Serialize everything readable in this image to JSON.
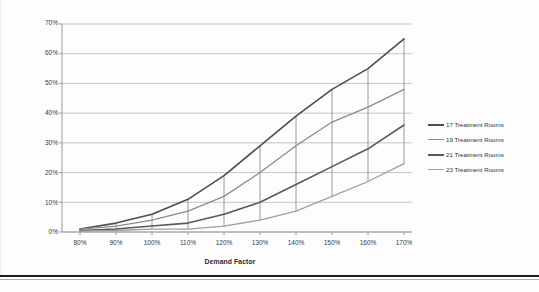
{
  "chart_data": {
    "type": "line",
    "title": "",
    "xlabel": "Demand Factor",
    "ylabel": "Percent of Patients",
    "categories": [
      "80%",
      "90%",
      "100%",
      "110%",
      "120%",
      "130%",
      "140%",
      "150%",
      "160%",
      "170%"
    ],
    "x": [
      80,
      90,
      100,
      110,
      120,
      130,
      140,
      150,
      160,
      170
    ],
    "xlim": [
      75,
      175
    ],
    "ylim": [
      0,
      70
    ],
    "y_ticks": [
      "0%",
      "10%",
      "20%",
      "30%",
      "40%",
      "50%",
      "60%",
      "70%"
    ],
    "y_tick_values": [
      0,
      10,
      20,
      30,
      40,
      50,
      60,
      70
    ],
    "x_ticks": [
      "80%",
      "90%",
      "100%",
      "110%",
      "120%",
      "130%",
      "140%",
      "150%",
      "160%",
      "170%"
    ],
    "grid": "horizontal",
    "legend_position": "right",
    "series": [
      {
        "name": "17 Treatment Rooms",
        "color": "#4d4d4d",
        "width": 1.6,
        "values": [
          1,
          3,
          6,
          11,
          19,
          29,
          39,
          48,
          55,
          65
        ]
      },
      {
        "name": "19 Treatment Rooms",
        "color": "#8c8c8c",
        "width": 1.3,
        "values": [
          1,
          2,
          4,
          7,
          12,
          20,
          29,
          37,
          42,
          48
        ]
      },
      {
        "name": "21 Treatment Rooms",
        "color": "#595959",
        "width": 1.6,
        "values": [
          0.5,
          1,
          2,
          3,
          6,
          10,
          16,
          22,
          28,
          36
        ]
      },
      {
        "name": "23 Treatment Rooms",
        "color": "#9e9e9e",
        "width": 1.3,
        "values": [
          0.3,
          0.5,
          1,
          1,
          2,
          4,
          7,
          12,
          17,
          23
        ]
      }
    ],
    "droplines": {
      "present": true,
      "color": "#808080",
      "description": "vertical connector lines at each category joining the highest and lowest series"
    },
    "axis_color": "#9a9a9a",
    "grid_color": "#b8b8b8"
  },
  "legend": {
    "items": [
      {
        "label": "17 Treatment Rooms"
      },
      {
        "label": "19 Treatment Rooms"
      },
      {
        "label": "21 Treatment Rooms"
      },
      {
        "label": "23 Treatment Rooms"
      }
    ]
  },
  "axes": {
    "y_title": "Percent of Patients",
    "x_title": "Demand Factor",
    "y_labels": [
      "70%",
      "60%",
      "50%",
      "40%",
      "30%",
      "20%",
      "10%",
      "0%"
    ],
    "x_labels": [
      "80%",
      "90%",
      "100%",
      "110%",
      "120%",
      "130%",
      "140%",
      "150%",
      "160%",
      "170%"
    ]
  }
}
